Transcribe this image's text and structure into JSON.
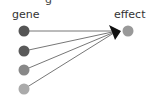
{
  "diagram": {
    "top_text_fragment": "g",
    "source_label": "gene",
    "target_label": "effect",
    "sources": [
      {
        "id": "gene-1",
        "cx": 24,
        "cy": 31,
        "r": 5.5,
        "color": "#555555"
      },
      {
        "id": "gene-2",
        "cx": 24,
        "cy": 51,
        "r": 5.5,
        "color": "#5a5a5a"
      },
      {
        "id": "gene-3",
        "cx": 24,
        "cy": 70,
        "r": 5.5,
        "color": "#888888"
      },
      {
        "id": "gene-4",
        "cx": 24,
        "cy": 89,
        "r": 5.5,
        "color": "#aaaaaa"
      }
    ],
    "target": {
      "id": "effect",
      "cx": 128,
      "cy": 31,
      "r": 5.5,
      "color": "#999999"
    },
    "edge_color": "#777777",
    "arrowhead_color": "#111111"
  }
}
